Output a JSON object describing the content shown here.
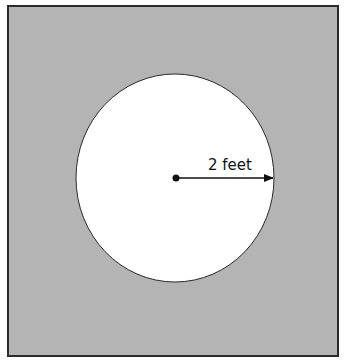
{
  "figure": {
    "square": {
      "fill": "#b4b4b4",
      "stroke": "#2a2a2a"
    },
    "circle": {
      "fill": "#ffffff",
      "stroke": "#2a2a2a"
    },
    "radius_label": "2 feet",
    "colors": {
      "line": "#111111",
      "text": "#111111"
    }
  }
}
